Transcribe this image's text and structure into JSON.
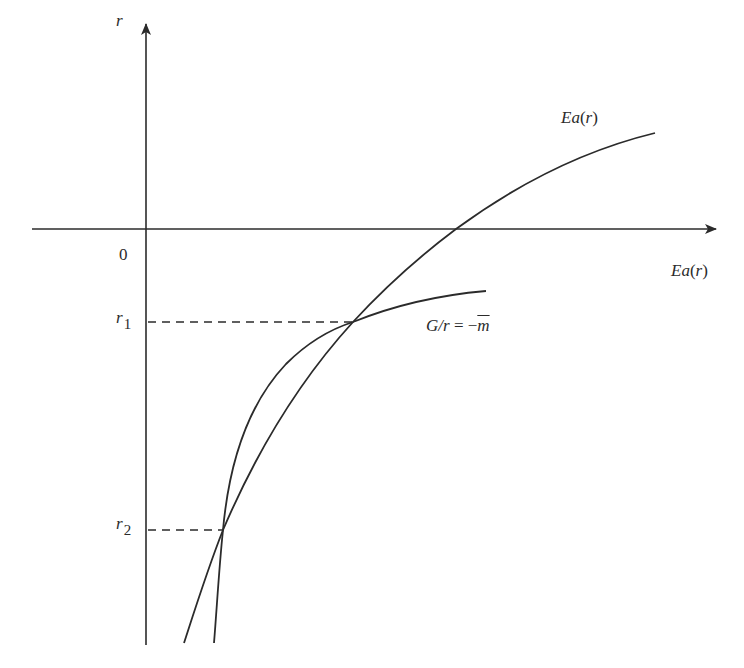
{
  "diagram": {
    "type": "economics-curve-diagram",
    "axes": {
      "y_axis_label": "r",
      "x_axis_label_func": "Ea",
      "x_axis_label_arg": "r",
      "origin_label": "0"
    },
    "curves": [
      {
        "id": "ea-curve",
        "label_func": "Ea",
        "label_arg": "r",
        "description": "Concave increasing curve crossing the horizontal axis"
      },
      {
        "id": "g-over-r-curve",
        "label_lhs": "G/r",
        "label_eq": " = −",
        "label_rhs": "m",
        "description": "Hyperbola-like curve, steep at bottom, flattening toward the right"
      }
    ],
    "intersections": [
      {
        "id": "r1",
        "label_base": "r",
        "label_sub": "1"
      },
      {
        "id": "r2",
        "label_base": "r",
        "label_sub": "2"
      }
    ],
    "colors": {
      "line": "#2b2b2b",
      "background": "#ffffff"
    }
  }
}
